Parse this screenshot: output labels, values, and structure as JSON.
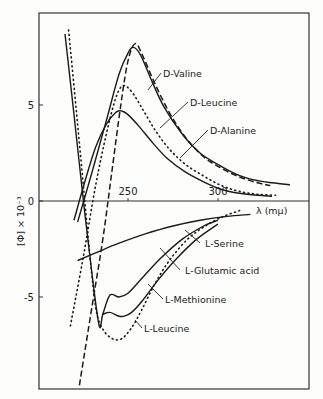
{
  "chart_data": {
    "type": "line",
    "title": "",
    "xlabel": "λ (mμ)",
    "ylabel": "[Φ] × 10⁻³",
    "xlim": [
      200,
      350
    ],
    "ylim": [
      -11,
      8.5
    ],
    "x_ticks": [
      250,
      300
    ],
    "y_ticks": [
      5,
      0,
      -5
    ],
    "x_tick_labels": [
      "250",
      "300"
    ],
    "y_tick_labels": [
      "5",
      "0",
      "-5"
    ],
    "grid": false,
    "legend": "inline annotations with leader lines",
    "series": [
      {
        "name": "D-Valine",
        "style": "solid",
        "points": [
          [
            222,
            -1.1
          ],
          [
            230,
            1.5
          ],
          [
            238,
            4.2
          ],
          [
            245,
            6.6
          ],
          [
            250,
            7.7
          ],
          [
            253,
            8.0
          ],
          [
            257,
            7.6
          ],
          [
            263,
            6.3
          ],
          [
            270,
            4.9
          ],
          [
            280,
            3.5
          ],
          [
            290,
            2.5
          ],
          [
            300,
            1.9
          ],
          [
            310,
            1.4
          ],
          [
            320,
            1.1
          ],
          [
            330,
            0.95
          ],
          [
            340,
            0.85
          ]
        ]
      },
      {
        "name": "D-Leucine",
        "style": "dashed",
        "points": [
          [
            223,
            -9.6
          ],
          [
            230,
            -5.5
          ],
          [
            236,
            -2
          ],
          [
            241,
            1.5
          ],
          [
            246,
            5
          ],
          [
            250,
            7.3
          ],
          [
            254,
            8.2
          ],
          [
            258,
            7.6
          ],
          [
            265,
            6.1
          ],
          [
            273,
            4.6
          ],
          [
            282,
            3.3
          ],
          [
            292,
            2.3
          ],
          [
            302,
            1.7
          ],
          [
            312,
            1.25
          ],
          [
            322,
            0.95
          ],
          [
            329,
            0.8
          ]
        ]
      },
      {
        "name": "D-Alanine",
        "style": "solid",
        "points": [
          [
            220,
            -1.0
          ],
          [
            226,
            1.0
          ],
          [
            232,
            2.8
          ],
          [
            238,
            4.0
          ],
          [
            243,
            4.6
          ],
          [
            246,
            4.7
          ],
          [
            250,
            4.5
          ],
          [
            256,
            3.9
          ],
          [
            264,
            3.0
          ],
          [
            272,
            2.2
          ],
          [
            282,
            1.5
          ],
          [
            292,
            1.0
          ],
          [
            302,
            0.6
          ],
          [
            312,
            0.4
          ],
          [
            322,
            0.3
          ],
          [
            330,
            0.25
          ]
        ]
      },
      {
        "name": "D-Leucine (dotted partner)",
        "style": "dotted",
        "points": [
          [
            218,
            -6.5
          ],
          [
            225,
            -3
          ],
          [
            232,
            0.8
          ],
          [
            238,
            3.5
          ],
          [
            243,
            5.3
          ],
          [
            247,
            6.0
          ],
          [
            252,
            5.7
          ],
          [
            258,
            4.8
          ],
          [
            265,
            3.7
          ],
          [
            273,
            2.7
          ],
          [
            282,
            1.9
          ],
          [
            292,
            1.3
          ],
          [
            302,
            0.8
          ],
          [
            312,
            0.5
          ],
          [
            322,
            0.35
          ],
          [
            332,
            0.3
          ]
        ]
      },
      {
        "name": "L-Serine",
        "style": "solid",
        "points": [
          [
            222,
            -3.1
          ],
          [
            232,
            -2.7
          ],
          [
            245,
            -2.2
          ],
          [
            260,
            -1.7
          ],
          [
            275,
            -1.3
          ],
          [
            290,
            -1.0
          ],
          [
            305,
            -0.8
          ],
          [
            318,
            -0.7
          ]
        ]
      },
      {
        "name": "L-Glutamic acid",
        "style": "solid",
        "points": [
          [
            215,
            8.7
          ],
          [
            220,
            4.5
          ],
          [
            225,
            0.2
          ],
          [
            230,
            -3.8
          ],
          [
            234,
            -6.5
          ],
          [
            236,
            -5.9
          ],
          [
            240,
            -4.9
          ],
          [
            245,
            -5.0
          ],
          [
            250,
            -4.8
          ],
          [
            258,
            -4.0
          ],
          [
            268,
            -3.0
          ],
          [
            280,
            -2.0
          ],
          [
            292,
            -1.3
          ],
          [
            300,
            -1.0
          ]
        ]
      },
      {
        "name": "L-Methionine",
        "style": "solid",
        "points": [
          [
            236,
            -5.9
          ],
          [
            240,
            -5.8
          ],
          [
            245,
            -6.0
          ],
          [
            248,
            -6.0
          ],
          [
            252,
            -5.8
          ],
          [
            258,
            -5.2
          ],
          [
            266,
            -4.2
          ],
          [
            276,
            -3.1
          ],
          [
            288,
            -2.0
          ],
          [
            300,
            -1.2
          ]
        ]
      },
      {
        "name": "L-Leucine",
        "style": "dotted",
        "points": [
          [
            217,
            8.9
          ],
          [
            221,
            5
          ],
          [
            225,
            1
          ],
          [
            229,
            -3
          ],
          [
            232,
            -5.5
          ],
          [
            235,
            -6.5
          ],
          [
            240,
            -7.1
          ],
          [
            246,
            -7.2
          ],
          [
            252,
            -6.6
          ],
          [
            258,
            -5.6
          ],
          [
            265,
            -4.3
          ],
          [
            273,
            -3.1
          ],
          [
            283,
            -2.0
          ],
          [
            293,
            -1.3
          ],
          [
            303,
            -0.8
          ],
          [
            312,
            -0.5
          ]
        ]
      }
    ],
    "annotations": [
      {
        "text": "D-Valine",
        "x": 163,
        "y": 77
      },
      {
        "text": "D-Leucine",
        "x": 190,
        "y": 106
      },
      {
        "text": "D-Alanine",
        "x": 210,
        "y": 134
      },
      {
        "text": "L-Serine",
        "x": 205,
        "y": 247
      },
      {
        "text": "L-Glutamic acid",
        "x": 185,
        "y": 274
      },
      {
        "text": "L-Methionine",
        "x": 165,
        "y": 303
      },
      {
        "text": "L-Leucine",
        "x": 144,
        "y": 332
      }
    ]
  }
}
